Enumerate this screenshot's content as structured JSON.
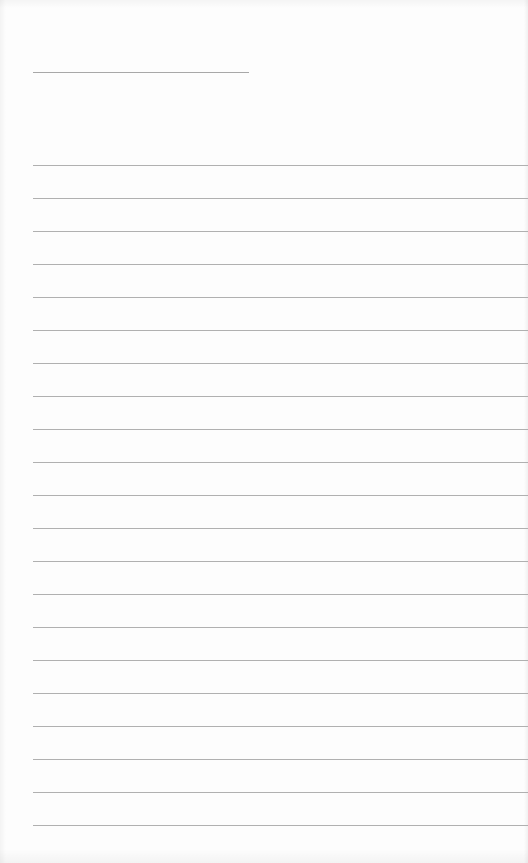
{
  "page": {
    "type": "lined-paper",
    "background": "#fdfdfd",
    "line_color": "#b0b0b0"
  },
  "header": {
    "label": "",
    "line": {
      "x": 33,
      "y": 72,
      "width": 216
    }
  },
  "ruled": {
    "count": 21,
    "start_y": 165,
    "spacing": 33,
    "x": 33,
    "width": 495,
    "lines": []
  }
}
